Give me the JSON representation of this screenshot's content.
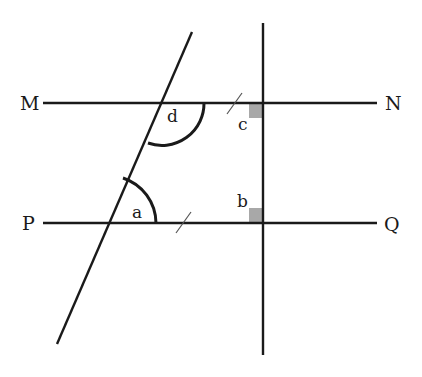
{
  "diagram": {
    "type": "geometry",
    "colors": {
      "line": "#1a1a1a",
      "right_angle_fill": "#a8a8a8",
      "background": "#ffffff"
    },
    "points": {
      "M": "M",
      "N": "N",
      "P": "P",
      "Q": "Q"
    },
    "angles": {
      "a": "a",
      "b": "b",
      "c": "c",
      "d": "d"
    },
    "lines": [
      {
        "id": "MN",
        "from": "M",
        "to": "N",
        "orientation": "horizontal"
      },
      {
        "id": "PQ",
        "from": "P",
        "to": "Q",
        "orientation": "horizontal"
      },
      {
        "id": "transversal",
        "orientation": "oblique"
      },
      {
        "id": "perpendicular",
        "orientation": "vertical"
      }
    ],
    "markings": {
      "parallel_ticks": 2,
      "right_angles": [
        "b",
        "c"
      ]
    }
  }
}
